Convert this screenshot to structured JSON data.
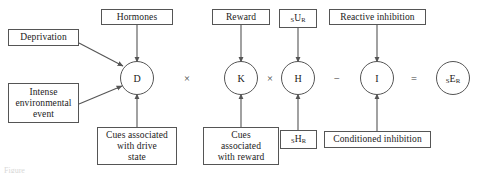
{
  "figure": {
    "caption_partial": "Figure",
    "stroke_color": "#555555",
    "background_color": "#ffffff",
    "text_color": "#1a1a1a"
  },
  "nodes": [
    {
      "id": "D",
      "label": "D"
    },
    {
      "id": "K",
      "label": "K"
    },
    {
      "id": "H",
      "label": "H"
    },
    {
      "id": "I",
      "label": "I"
    },
    {
      "id": "sER",
      "label_html": "<sub>S</sub>E<sub>R</sub>"
    }
  ],
  "operators": [
    {
      "id": "times-1",
      "symbol": "×"
    },
    {
      "id": "times-2",
      "symbol": "×"
    },
    {
      "id": "minus",
      "symbol": "−"
    },
    {
      "id": "equals",
      "symbol": "="
    }
  ],
  "top_boxes": [
    {
      "id": "hormones",
      "label": "Hormones"
    },
    {
      "id": "reward",
      "label": "Reward"
    },
    {
      "id": "sUR",
      "label_html": "<sub>S</sub>U<sub>R</sub>"
    },
    {
      "id": "reactive-inhibition",
      "label": "Reactive inhibition"
    }
  ],
  "left_boxes": [
    {
      "id": "deprivation",
      "label": "Deprivation"
    },
    {
      "id": "intense-environmental-event",
      "label": "Intense\nenvironmental\nevent"
    }
  ],
  "bottom_boxes": [
    {
      "id": "cues-drive-state",
      "label": "Cues associated\nwith drive\nstate"
    },
    {
      "id": "cues-reward",
      "label": "Cues\nassociated\nwith reward"
    },
    {
      "id": "sHR",
      "label_html": "<sub>S</sub>H<sub>R</sub>"
    },
    {
      "id": "conditioned-inhibition",
      "label": "Conditioned inhibition"
    }
  ]
}
